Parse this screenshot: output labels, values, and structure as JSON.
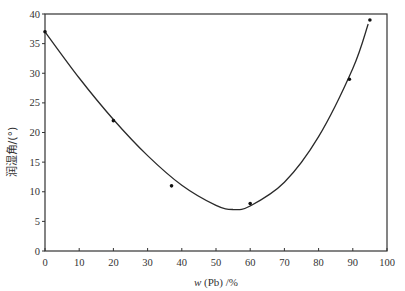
{
  "chart_data": {
    "type": "scatter",
    "title": "",
    "xlabel": "w (Pb) /%",
    "xlabel_parts": {
      "var": "w",
      "rest": " (Pb) /%"
    },
    "ylabel": "润湿角/(°)",
    "xlim": [
      0,
      100
    ],
    "ylim": [
      0,
      40
    ],
    "xticks": [
      0,
      10,
      20,
      30,
      40,
      50,
      60,
      70,
      80,
      90,
      100
    ],
    "yticks": [
      0,
      5,
      10,
      15,
      20,
      25,
      30,
      35,
      40
    ],
    "grid": false,
    "legend": null,
    "series": [
      {
        "name": "measured",
        "kind": "scatter",
        "x": [
          0,
          20,
          37,
          60,
          89,
          95
        ],
        "y": [
          37,
          22,
          11,
          8,
          29,
          39
        ]
      },
      {
        "name": "fit",
        "kind": "line",
        "x": [
          0,
          10,
          20,
          30,
          40,
          50,
          55,
          60,
          70,
          80,
          90,
          94.5
        ],
        "y": [
          37,
          29.2,
          22.2,
          16.1,
          11.1,
          7.7,
          7,
          7.6,
          11.6,
          19.3,
          30.8,
          38.3
        ]
      }
    ]
  },
  "colors": {
    "line": "#2a2a2a",
    "axis": "#333333",
    "point": "#111111"
  }
}
